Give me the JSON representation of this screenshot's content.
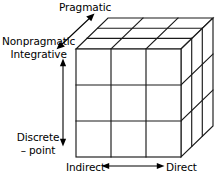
{
  "figure": {
    "type": "3d-cube-diagram",
    "title": "",
    "cube": {
      "divisions_per_edge": 3,
      "total_cells": 27,
      "line_color": "#1a1a1a"
    },
    "axes": {
      "depth": {
        "name": "pragmatic-axis",
        "direction": "diagonal-up-right",
        "arrow": "double-headed",
        "low_label": "Nonpragmatic",
        "high_label": "Pragmatic"
      },
      "vertical": {
        "name": "integrative-axis",
        "direction": "vertical",
        "arrow": "double-headed",
        "high_label": "Integrative",
        "low_label_line1": "Discrete",
        "low_label_line2": "– point"
      },
      "horizontal": {
        "name": "directness-axis",
        "direction": "horizontal",
        "arrow": "double-headed",
        "left_label": "Indirect",
        "right_label": "Direct"
      }
    }
  },
  "colors": {
    "background": "#ffffff",
    "ink": "#000000",
    "line": "#1a1a1a"
  }
}
